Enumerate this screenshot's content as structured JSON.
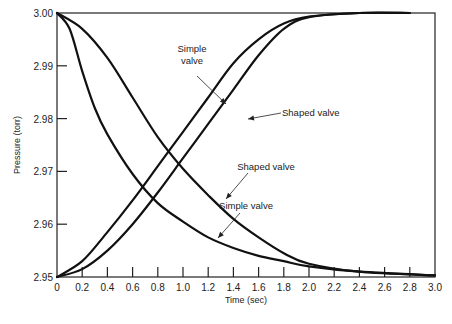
{
  "chart_data": {
    "type": "line",
    "title": "",
    "xlabel": "Time (sec)",
    "ylabel": "Pressure (torr)",
    "xlim": [
      0,
      3.0
    ],
    "ylim": [
      2.95,
      3.0
    ],
    "x_ticks": [
      "0",
      "0.2",
      "0.4",
      "0.6",
      "0.8",
      "1.0",
      "1.2",
      "1.4",
      "1.6",
      "1.8",
      "2.0",
      "2.2",
      "2.4",
      "2.6",
      "2.8",
      "3.0"
    ],
    "y_ticks": [
      "2.95",
      "2.96",
      "2.97",
      "2.98",
      "2.99",
      "3.00"
    ],
    "grid": false,
    "legend": "none (inline annotations)",
    "series": [
      {
        "name": "Simple valve (rising)",
        "x": [
          0,
          0.2,
          0.4,
          0.6,
          0.8,
          1.0,
          1.2,
          1.4,
          1.6,
          1.8,
          2.0,
          2.4,
          2.8
        ],
        "values": [
          2.95,
          2.953,
          2.9585,
          2.9645,
          2.971,
          2.9775,
          2.984,
          2.9905,
          2.995,
          2.998,
          2.9993,
          3.0,
          3.0
        ]
      },
      {
        "name": "Shaped valve (rising)",
        "x": [
          0,
          0.2,
          0.4,
          0.6,
          0.8,
          1.0,
          1.2,
          1.4,
          1.6,
          1.8,
          2.0,
          2.4,
          2.8
        ],
        "values": [
          2.95,
          2.9515,
          2.955,
          2.96,
          2.966,
          2.9725,
          2.979,
          2.9855,
          2.992,
          2.997,
          2.9992,
          3.0,
          3.0
        ]
      },
      {
        "name": "Simple valve (falling)",
        "x": [
          0,
          0.1,
          0.2,
          0.3,
          0.4,
          0.6,
          0.8,
          1.0,
          1.2,
          1.4,
          1.6,
          1.8,
          2.0,
          2.4,
          3.0
        ],
        "values": [
          3.0,
          2.997,
          2.989,
          2.982,
          2.977,
          2.9695,
          2.964,
          2.9605,
          2.9575,
          2.9555,
          2.954,
          2.953,
          2.952,
          2.951,
          2.9503
        ]
      },
      {
        "name": "Shaped valve (falling)",
        "x": [
          0,
          0.2,
          0.4,
          0.6,
          0.8,
          1.0,
          1.2,
          1.4,
          1.6,
          1.8,
          2.0,
          2.4,
          3.0
        ],
        "values": [
          3.0,
          2.997,
          2.9915,
          2.984,
          2.9765,
          2.9705,
          2.9655,
          2.961,
          2.9575,
          2.9545,
          2.9525,
          2.951,
          2.9503
        ]
      }
    ],
    "annotations": [
      {
        "text": [
          "Simple",
          "valve"
        ],
        "points_to": "Simple valve (rising)"
      },
      {
        "text": [
          "Shaped valve"
        ],
        "points_to": "Shaped valve (rising)"
      },
      {
        "text": [
          "Shaped valve"
        ],
        "points_to": "Shaped valve (falling)"
      },
      {
        "text": [
          "Simple valve"
        ],
        "points_to": "Simple valve (falling)"
      }
    ]
  }
}
